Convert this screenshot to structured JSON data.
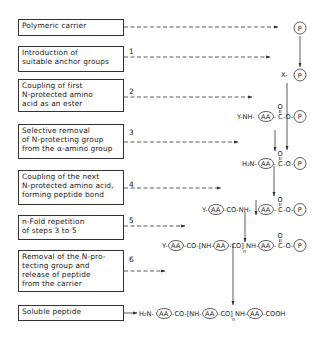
{
  "diagram": {
    "steps": [
      {
        "label": "Polymeric carrier",
        "number": ""
      },
      {
        "label": "Introduction of\nsuitable anchor groups",
        "number": "1"
      },
      {
        "label": "Coupling of first\nN-protected amino\nacid as an ester",
        "number": "2"
      },
      {
        "label": "Selective removal\nof N-protecting group\nfrom the α-amino group",
        "number": "3"
      },
      {
        "label": "Coupling of the next\nN-protected amino acid,\nforming peptide bond",
        "number": "4"
      },
      {
        "label": "n-Fold repetition\nof steps 3 to 5",
        "number": "5"
      },
      {
        "label": "Removal of the N-pro-\ntecting group and\nrelease of peptide\nfrom the carrier",
        "number": "6"
      },
      {
        "label": "Soluble peptide",
        "number": ""
      }
    ],
    "structures": {
      "s0": "P",
      "s1": "X-(P)",
      "s2": "Y-NH-(AA)-C(=O)-O-(P)",
      "s3": "H2N-(AA)-C(=O)-O-(P)",
      "s4": "Y-(AA)-CO-NH-(AA)-C(=O)-O-(P)",
      "s5": "Y-(AA)-CO-[NH-(AA)-CO]n-NH-(AA)-C(=O)-O-(P)",
      "s6": "H2N-(AA)-CO-[NH-(AA)-CO]n-NH-(AA)-COOH"
    },
    "labels": {
      "P": "P",
      "AA": "AA",
      "X": "X-",
      "Y": "Y-",
      "YNH": "Y-NH-",
      "H2N": "H₂N-",
      "C": "C",
      "O": "O",
      "CO": "-CO-",
      "NH": "NH-",
      "COOH": "-COOH",
      "n": "n"
    }
  }
}
